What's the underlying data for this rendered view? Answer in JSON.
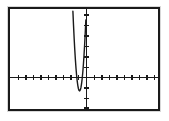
{
  "window": {
    "title": "Graphing calculator plot",
    "background_color": "#ffffff",
    "frame_color": "#1a1a1a",
    "frame_shadow_color": "#d8d8d8"
  },
  "graph": {
    "curve_color": "#1a1a1a",
    "axis_color": "#1a1a1a",
    "curve_label": "upward parabola",
    "vertex_label": "vertex on x-axis"
  },
  "chart_data": {
    "type": "line",
    "title": "",
    "subtitle": "",
    "xlabel": "",
    "ylabel": "",
    "grid": false,
    "legend": "none",
    "annotations": [],
    "axes": {
      "x_axis_visible": true,
      "y_axis_visible": true,
      "x_axis_y_value": 0,
      "y_axis_x_value": 0,
      "xlim": [
        -10,
        10
      ],
      "ylim": [
        -2.2,
        10
      ],
      "x_tick_interval": 1,
      "y_tick_interval": 1,
      "x_tick_values": [
        -9,
        -8,
        -7,
        -6,
        -5,
        -4,
        -3,
        -2,
        -1,
        1,
        2,
        3,
        4,
        5,
        6,
        7,
        8,
        9
      ],
      "y_tick_values": [
        -2,
        -1,
        1,
        2,
        3,
        4,
        5,
        6,
        7,
        8,
        9
      ],
      "tick_labels_shown": false
    },
    "series": [
      {
        "name": "y = 12(x + 0.6)^2",
        "equation": "y = 12(x + 0.6)^2",
        "vertex": [
          -0.6,
          0
        ],
        "opens": "up",
        "leading_coefficient": 12,
        "color": "#1a1a1a",
        "x": [
          -1.5,
          -1.4,
          -1.3,
          -1.2,
          -1.1,
          -1.0,
          -0.9,
          -0.8,
          -0.7,
          -0.6,
          -0.5,
          -0.4,
          -0.3,
          -0.2,
          -0.1,
          0.0,
          0.1,
          0.2,
          0.3
        ],
        "y": [
          9.72,
          7.68,
          5.88,
          4.32,
          3.0,
          1.92,
          1.08,
          0.48,
          0.12,
          0.0,
          0.12,
          0.48,
          1.08,
          1.92,
          3.0,
          4.32,
          5.88,
          7.68,
          9.72
        ]
      }
    ]
  }
}
